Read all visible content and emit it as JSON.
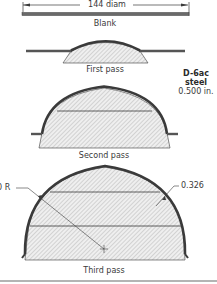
{
  "diagram": {
    "type": "forming-sequence",
    "colors": {
      "line": "#3a3a3a",
      "hatch": "#9a9a9a",
      "fill": "#e8e8e8",
      "text": "#3a3a3a"
    },
    "blank": {
      "dimension_label": "144 diam",
      "caption": "Blank"
    },
    "stages": [
      {
        "id": "first",
        "caption": "First pass"
      },
      {
        "id": "second",
        "caption": "Second pass"
      },
      {
        "id": "third",
        "caption": "Third pass"
      }
    ],
    "material": {
      "line1": "D-6ac",
      "line2": "steel",
      "line3": "0.500 in."
    },
    "annotations": {
      "radius_label": "0 R",
      "thickness_label": "0.326"
    }
  }
}
